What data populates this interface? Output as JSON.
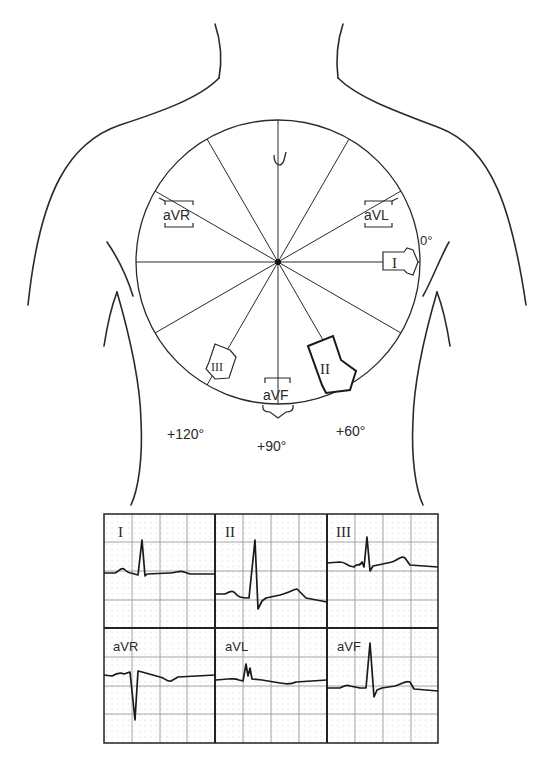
{
  "diagram": {
    "center": [
      278,
      262
    ],
    "radius": 142,
    "axes_degrees": [
      0,
      30,
      60,
      90,
      120,
      150,
      180,
      210,
      240,
      270,
      300,
      330
    ],
    "lead_labels": {
      "I": "I",
      "II": "II",
      "III": "III",
      "aVR": "aVR",
      "aVL": "aVL",
      "aVF": "aVF"
    },
    "angle_labels": {
      "deg0": "0°",
      "deg60": "+60°",
      "deg90": "+90°",
      "deg120": "+120°"
    },
    "emphasized_lead": "II",
    "line_color": "#2a2a2a"
  },
  "ecg_panel": {
    "grid_color": "#9a9a9a",
    "dot_color": "#b8b8b8",
    "border_color": "#222222",
    "rows": [
      [
        {
          "lead": "I",
          "label": "I"
        },
        {
          "lead": "II",
          "label": "II"
        },
        {
          "lead": "III",
          "label": "III"
        }
      ],
      [
        {
          "lead": "aVR",
          "label": "aVR"
        },
        {
          "lead": "aVL",
          "label": "aVL"
        },
        {
          "lead": "aVF",
          "label": "aVF"
        }
      ]
    ]
  }
}
